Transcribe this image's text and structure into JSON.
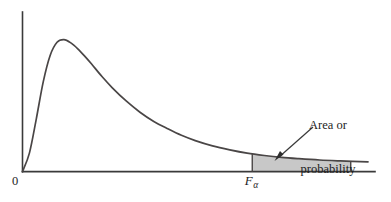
{
  "figure": {
    "kind": "f-distribution-density-with-shaded-upper-tail",
    "background_color": "#ffffff",
    "curve_color": "#4a4646",
    "axis_color": "#3a3a3a",
    "shade_color": "#c8c8c8",
    "labels": {
      "origin": "0",
      "critical_value_symbol": "F",
      "critical_value_subscript": "α",
      "annotation_line_1": "Area or",
      "annotation_line_2": "probability"
    }
  },
  "chart_data": {
    "type": "area",
    "title": "",
    "subtitle": "",
    "xlabel": "",
    "ylabel": "",
    "grid": false,
    "legend": null,
    "axis_origin_label": "0",
    "xlim": [
      0,
      10
    ],
    "ylim": [
      0,
      1.05
    ],
    "series": [
      {
        "name": "F density curve",
        "x": [
          0.0,
          0.2,
          0.4,
          0.6,
          0.8,
          1.0,
          1.2,
          1.4,
          1.6,
          1.8,
          2.0,
          2.3,
          2.6,
          3.0,
          3.4,
          3.8,
          4.2,
          4.6,
          5.0,
          5.5,
          6.0,
          6.5,
          7.0,
          7.5,
          8.0,
          8.6,
          9.2,
          10.0
        ],
        "y": [
          0.0,
          0.14,
          0.4,
          0.68,
          0.88,
          0.98,
          1.0,
          0.975,
          0.93,
          0.875,
          0.815,
          0.72,
          0.635,
          0.535,
          0.45,
          0.38,
          0.325,
          0.275,
          0.235,
          0.195,
          0.165,
          0.14,
          0.122,
          0.108,
          0.098,
          0.088,
          0.081,
          0.073
        ]
      }
    ],
    "shaded_region": {
      "label": "Area or probability",
      "from_x": 6.65,
      "to_x": 9.5,
      "fill": "#c8c8c8",
      "boundary_label": "F_alpha"
    },
    "annotations": [
      {
        "text": "Area or probability",
        "target_x": 7.1,
        "target_y": 0.15,
        "arrow": true
      },
      {
        "text": "F",
        "subscript": "α",
        "x": 6.65,
        "y": 0,
        "arrow": false
      }
    ]
  }
}
